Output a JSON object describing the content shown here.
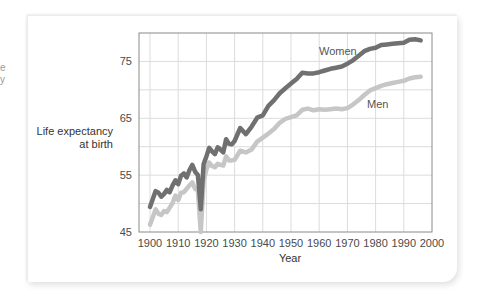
{
  "chart_data": {
    "type": "line",
    "title": "",
    "xlabel": "Year",
    "ylabel": "Life expectancy at birth",
    "ylabel_lines": [
      "Life expectancy",
      "at birth"
    ],
    "xlim": [
      1900,
      2000
    ],
    "ylim": [
      45,
      80
    ],
    "x_ticks": [
      1900,
      1910,
      1920,
      1930,
      1940,
      1950,
      1960,
      1970,
      1980,
      1990,
      2000
    ],
    "y_ticks": [
      45,
      55,
      65,
      75
    ],
    "y_gridlines": [
      45,
      50,
      55,
      60,
      65,
      70,
      75,
      80
    ],
    "grid": true,
    "legend": "inline labels",
    "series": [
      {
        "name": "Women",
        "color": "#707070",
        "label_position": {
          "year": 1963,
          "value": 77.5
        },
        "x": [
          1900,
          1901,
          1902,
          1903,
          1904,
          1905,
          1906,
          1907,
          1908,
          1909,
          1910,
          1911,
          1912,
          1913,
          1914,
          1915,
          1916,
          1917,
          1918,
          1919,
          1920,
          1921,
          1922,
          1923,
          1924,
          1925,
          1926,
          1927,
          1928,
          1929,
          1930,
          1932,
          1934,
          1936,
          1938,
          1940,
          1942,
          1944,
          1946,
          1948,
          1950,
          1952,
          1954,
          1956,
          1958,
          1960,
          1962,
          1964,
          1966,
          1968,
          1970,
          1972,
          1974,
          1976,
          1978,
          1980,
          1982,
          1984,
          1986,
          1988,
          1990,
          1992,
          1994,
          1996
        ],
        "values": [
          49.4,
          50.8,
          52.2,
          51.9,
          51.2,
          51.7,
          52.4,
          52.0,
          53.2,
          54.1,
          53.4,
          54.9,
          55.3,
          54.6,
          55.9,
          56.8,
          55.6,
          55.0,
          49.0,
          56.9,
          58.3,
          59.8,
          59.2,
          58.7,
          59.9,
          59.5,
          59.0,
          61.3,
          60.5,
          60.4,
          61.0,
          63.3,
          62.2,
          63.5,
          65.1,
          65.5,
          67.2,
          68.2,
          69.4,
          70.3,
          71.1,
          71.9,
          73.0,
          72.9,
          72.9,
          73.1,
          73.4,
          73.7,
          73.9,
          74.1,
          74.6,
          75.2,
          76.0,
          76.8,
          77.2,
          77.4,
          77.9,
          78.0,
          78.1,
          78.2,
          78.3,
          78.8,
          78.9,
          78.7
        ]
      },
      {
        "name": "Men",
        "color": "#c6c6c6",
        "label_position": {
          "year": 1983,
          "value": 66.8
        },
        "x": [
          1900,
          1901,
          1902,
          1903,
          1904,
          1905,
          1906,
          1907,
          1908,
          1909,
          1910,
          1911,
          1912,
          1913,
          1914,
          1915,
          1916,
          1917,
          1918,
          1919,
          1920,
          1921,
          1922,
          1923,
          1924,
          1925,
          1926,
          1927,
          1928,
          1929,
          1930,
          1932,
          1934,
          1936,
          1938,
          1940,
          1942,
          1944,
          1946,
          1948,
          1950,
          1952,
          1954,
          1956,
          1958,
          1960,
          1962,
          1964,
          1966,
          1968,
          1970,
          1972,
          1974,
          1976,
          1978,
          1980,
          1982,
          1984,
          1986,
          1988,
          1990,
          1992,
          1994,
          1996
        ],
        "values": [
          46.3,
          47.6,
          49.0,
          48.2,
          48.0,
          48.7,
          48.5,
          49.3,
          50.1,
          51.4,
          50.6,
          51.9,
          52.0,
          52.6,
          53.2,
          53.7,
          52.6,
          52.3,
          36.6,
          54.0,
          56.0,
          57.2,
          56.6,
          56.4,
          57.0,
          56.8,
          56.7,
          58.3,
          57.6,
          57.6,
          57.7,
          59.3,
          59.0,
          59.5,
          60.9,
          61.6,
          62.3,
          63.1,
          64.2,
          64.9,
          65.2,
          65.5,
          66.5,
          66.7,
          66.4,
          66.6,
          66.5,
          66.6,
          66.7,
          66.6,
          66.8,
          67.4,
          68.2,
          69.1,
          69.9,
          70.3,
          70.7,
          71.0,
          71.2,
          71.4,
          71.6,
          72.0,
          72.2,
          72.3
        ]
      }
    ]
  },
  "labels": {
    "y_axis_line1": "Life expectancy",
    "y_axis_line2": "at birth",
    "x_axis": "Year",
    "women": "Women",
    "men": "Men"
  },
  "left_fragment": {
    "line1": "e",
    "line2": "y"
  }
}
